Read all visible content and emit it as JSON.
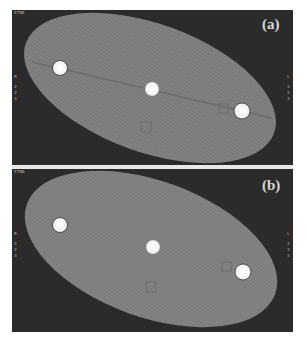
{
  "figure": {
    "panels": [
      {
        "label": "(a)",
        "corner_top": "STND",
        "left_marker": {
          "letter": "R",
          "digits": [
            "2",
            "2",
            "3"
          ]
        },
        "right_marker": {
          "letter": "L",
          "digits": [
            "2",
            "2",
            "3"
          ]
        },
        "ellipse": {
          "cx": 138,
          "cy": 78,
          "rx": 132,
          "ry": 64,
          "rotate": 20,
          "fill": "#7d7d7d"
        },
        "discs": [
          {
            "cx": 48,
            "cy": 58,
            "r": 7.5
          },
          {
            "cx": 140,
            "cy": 79,
            "r": 7
          },
          {
            "cx": 230,
            "cy": 101,
            "r": 8
          }
        ],
        "rois": [
          {
            "x": 129,
            "y": 112,
            "size": 10
          },
          {
            "x": 207,
            "y": 94,
            "size": 9
          }
        ]
      },
      {
        "label": "(b)",
        "corner_top": "STND",
        "corner_bottom": "",
        "left_marker": {
          "letter": "R",
          "digits": [
            "2",
            "2",
            "3"
          ]
        },
        "right_marker": {
          "letter": "L",
          "digits": [
            "2",
            "2",
            "3"
          ]
        },
        "ellipse": {
          "cx": 139,
          "cy": 80,
          "rx": 132,
          "ry": 68,
          "rotate": 20,
          "fill": "#7f7f7f"
        },
        "discs": [
          {
            "cx": 48,
            "cy": 56,
            "r": 7.5
          },
          {
            "cx": 141,
            "cy": 78,
            "r": 7
          },
          {
            "cx": 231,
            "cy": 103,
            "r": 8
          }
        ],
        "rois": [
          {
            "x": 134,
            "y": 113,
            "size": 10
          },
          {
            "x": 210,
            "y": 93,
            "size": 9
          }
        ]
      }
    ],
    "colors": {
      "background": "#2b2b2b",
      "phantom": "#7d7d7d",
      "disc": "#f4f4f4",
      "label": "#d8d8d8",
      "divider": "#e8e8e8"
    }
  }
}
